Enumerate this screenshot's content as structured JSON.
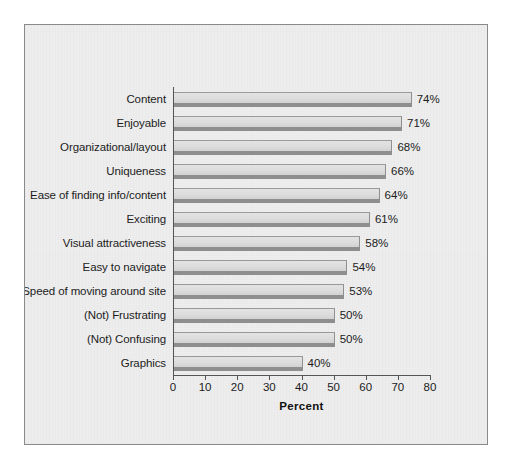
{
  "chart_data": {
    "type": "bar",
    "orientation": "horizontal",
    "title": "",
    "xlabel": "Percent",
    "ylabel": "",
    "xlim": [
      0,
      80
    ],
    "xticks": [
      0,
      10,
      20,
      30,
      40,
      50,
      60,
      70,
      80
    ],
    "grid": false,
    "legend": null,
    "categories": [
      "Content",
      "Enjoyable",
      "Organizational/layout",
      "Uniqueness",
      "Ease of finding info/content",
      "Exciting",
      "Visual attractiveness",
      "Easy to navigate",
      "Speed of moving around site",
      "(Not) Frustrating",
      "(Not) Confusing",
      "Graphics"
    ],
    "values": [
      74,
      71,
      68,
      66,
      64,
      61,
      58,
      54,
      53,
      50,
      50,
      40
    ],
    "data_labels": [
      "74%",
      "71%",
      "68%",
      "66%",
      "64%",
      "61%",
      "58%",
      "54%",
      "53%",
      "50%",
      "50%",
      "40%"
    ],
    "colors": {
      "bar_fill": "#dcdcdc",
      "bar_shadow": "#8e8e8e",
      "bar_outline": "#8f8f8f",
      "axis": "#555555",
      "text": "#1c1c1c",
      "plot_background": "#eeeeee",
      "frame_border": "#8a8a8a",
      "page_background": "#ffffff"
    }
  }
}
